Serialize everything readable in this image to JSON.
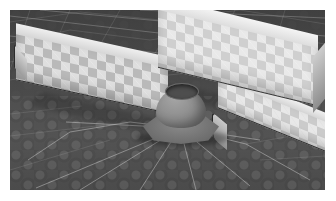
{
  "scene": {
    "title": "3D rendered corner scene",
    "description": "Low-poly 3D viewport render showing two checkered low walls meeting at a back corner, a ceramic pot on an octagonal pedestal, and a third thin wall running to the lower right across a dark textured ground plane with white wireframe triangulation lines.",
    "renderer_view": "perspective",
    "frame": {
      "margin_px": 10,
      "content_width_px": 315,
      "content_height_px": 180,
      "background_color": "#ffffff"
    },
    "colors": {
      "ground_dark": "#434343",
      "ground_mid": "#4e4e4e",
      "ground_light": "#535353",
      "wall_face": "#cfcfcf",
      "wall_face_shadow": "#b9b9b9",
      "wall_top": "#f4f4f4",
      "wall_outline": "#2a2a2a",
      "pot_body": "#8f8f8f",
      "pot_rim_dark": "#4e4e4e",
      "pedestal": "#6d6d6d",
      "wireframe_line": "#ebebeb",
      "shadow": "#000000"
    },
    "objects": [
      {
        "id": "wall-left",
        "label": "Left wall",
        "material": "checkered tile",
        "orientation": "recedes to upper-right from lower-left",
        "length_px": 152,
        "height_px": 46
      },
      {
        "id": "wall-right",
        "label": "Right wall",
        "material": "checkered tile",
        "orientation": "recedes to lower-right from back corner",
        "length_px": 160,
        "height_px": 58
      },
      {
        "id": "wall-far",
        "label": "Far right wall segment",
        "material": "checkered tile",
        "orientation": "runs to lower-right, partially occluded",
        "length_px": 122,
        "height_px": 30
      },
      {
        "id": "pedestal",
        "label": "Octagonal pedestal",
        "material": "stone",
        "sides": 8
      },
      {
        "id": "pot",
        "label": "Ceramic pot",
        "material": "clay",
        "opening": "dark circular rim"
      },
      {
        "id": "ground",
        "label": "Ground plane",
        "material": "patterned cobble with wireframe overlay"
      }
    ],
    "overlays": {
      "wireframe_enabled": true,
      "wireframe_color": "#ebebeb",
      "wireframe_style": "triangulated mesh lines"
    },
    "lighting": {
      "key_direction": "upper-left",
      "shadows": "soft contact shadows under walls and pedestal"
    }
  }
}
